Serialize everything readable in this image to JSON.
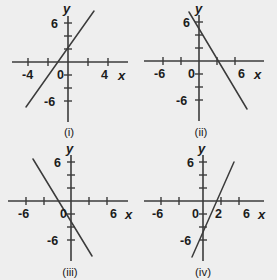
{
  "figure": {
    "background_color": "#eeeeee",
    "ink_color": "#3b3b3b",
    "width": 277,
    "height": 280
  },
  "panels": [
    {
      "id": "panel-i",
      "caption": "(i)",
      "axis_labels": {
        "x": "x",
        "y": "y"
      },
      "x_tick_labels": [
        "-4",
        "0",
        "4"
      ],
      "y_tick_labels": [
        "6",
        "-6"
      ],
      "chart_data": {
        "type": "line",
        "title": "(i)",
        "xlabel": "x",
        "ylabel": "y",
        "xlim": [
          -6,
          6
        ],
        "ylim": [
          -8,
          8
        ],
        "xticks": [
          -6,
          -4,
          -2,
          0,
          2,
          4,
          6
        ],
        "xticklabels": [
          "",
          "-4",
          "",
          "0",
          "",
          "4",
          ""
        ],
        "yticks": [
          -6,
          -4,
          -2,
          2,
          4,
          6
        ],
        "yticklabels": [
          "-6",
          "",
          "",
          "",
          "",
          "6"
        ],
        "grid": false,
        "series": [
          {
            "name": "line-i",
            "slope": 2,
            "intercept": 3,
            "x": [
              -5.3,
              2.1
            ],
            "y": [
              -7.6,
              7.2
            ],
            "x_intercept": -1.5,
            "y_intercept": 3
          }
        ]
      }
    },
    {
      "id": "panel-ii",
      "caption": "(ii)",
      "axis_labels": {
        "x": "x",
        "y": "y"
      },
      "x_tick_labels": [
        "-6",
        "0",
        "6"
      ],
      "y_tick_labels": [
        "6",
        "-6"
      ],
      "chart_data": {
        "type": "line",
        "title": "(ii)",
        "xlabel": "x",
        "ylabel": "y",
        "xlim": [
          -8,
          8
        ],
        "ylim": [
          -8,
          8
        ],
        "xticks": [
          -6,
          -4,
          -2,
          0,
          2,
          4,
          6
        ],
        "xticklabels": [
          "-6",
          "",
          "",
          "0",
          "",
          "",
          "6"
        ],
        "yticks": [
          -6,
          -4,
          -2,
          2,
          4,
          6
        ],
        "yticklabels": [
          "-6",
          "",
          "",
          "",
          "",
          "6"
        ],
        "grid": false,
        "series": [
          {
            "name": "line-ii",
            "slope": -2,
            "intercept": 4,
            "x": [
              -1.2,
              5.3
            ],
            "y": [
              6.4,
              -6.6
            ],
            "x_intercept": 2,
            "y_intercept": 4
          }
        ]
      }
    },
    {
      "id": "panel-iii",
      "caption": "(iii)",
      "axis_labels": {
        "x": "x",
        "y": "y"
      },
      "x_tick_labels": [
        "-6",
        "0",
        "6"
      ],
      "y_tick_labels": [
        "6",
        "-6"
      ],
      "chart_data": {
        "type": "line",
        "title": "(iii)",
        "xlabel": "x",
        "ylabel": "y",
        "xlim": [
          -8,
          8
        ],
        "ylim": [
          -8,
          8
        ],
        "xticks": [
          -6,
          -4,
          -2,
          0,
          2,
          4,
          6
        ],
        "xticklabels": [
          "-6",
          "",
          "",
          "0",
          "",
          "",
          "6"
        ],
        "yticks": [
          -6,
          -4,
          -2,
          2,
          4,
          6
        ],
        "yticklabels": [
          "-6",
          "",
          "",
          "",
          "",
          "6"
        ],
        "grid": false,
        "series": [
          {
            "name": "line-iii",
            "slope": -2,
            "intercept": -2,
            "x": [
              -4.4,
              2.6
            ],
            "y": [
              6.8,
              -7.2
            ],
            "x_intercept": -1,
            "y_intercept": -2
          }
        ]
      }
    },
    {
      "id": "panel-iv",
      "caption": "(iv)",
      "axis_labels": {
        "x": "x",
        "y": "y"
      },
      "x_tick_labels": [
        "-6",
        "0",
        "2",
        "6"
      ],
      "y_tick_labels": [
        "6",
        "-6"
      ],
      "chart_data": {
        "type": "line",
        "title": "(iv)",
        "xlabel": "x",
        "ylabel": "y",
        "xlim": [
          -8,
          8
        ],
        "ylim": [
          -8,
          8
        ],
        "xticks": [
          -6,
          -4,
          -2,
          0,
          2,
          4,
          6
        ],
        "xticklabels": [
          "-6",
          "",
          "",
          "0",
          "2",
          "",
          "6"
        ],
        "yticks": [
          -6,
          -4,
          -2,
          2,
          4,
          6
        ],
        "yticklabels": [
          "-6",
          "",
          "",
          "",
          "",
          "6"
        ],
        "grid": false,
        "series": [
          {
            "name": "line-iv",
            "slope": 2.5,
            "intercept": -5,
            "x": [
              -1.1,
              3.5
            ],
            "y": [
              -7.7,
              3.8
            ],
            "x_intercept": 2,
            "y_intercept": -5
          }
        ]
      }
    }
  ]
}
